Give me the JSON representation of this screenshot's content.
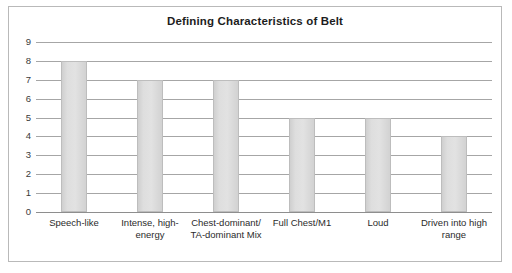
{
  "chart_data": {
    "type": "bar",
    "title": "Defining Characteristics of Belt",
    "xlabel": "",
    "ylabel": "",
    "ylim": [
      0,
      9
    ],
    "ytick_step": 1,
    "yticks": [
      "9",
      "8",
      "7",
      "6",
      "5",
      "4",
      "3",
      "2",
      "1",
      "0"
    ],
    "grid": true,
    "legend": "none",
    "categories": [
      "Speech-like",
      "Intense, high-energy",
      "Chest-dominant/ TA-dominant Mix",
      "Full Chest/M1",
      "Loud",
      "Driven into high range"
    ],
    "category_lines": [
      [
        "Speech-like"
      ],
      [
        "Intense, high-",
        "energy"
      ],
      [
        "Chest-dominant/",
        "TA-dominant Mix"
      ],
      [
        "Full Chest/M1"
      ],
      [
        "Loud"
      ],
      [
        "Driven into high",
        "range"
      ]
    ],
    "values": [
      8,
      7,
      7,
      5,
      5,
      4
    ],
    "colors": {
      "bar_fill": "#dedede",
      "bar_border": "#bdbdbd",
      "gridline": "#a6a6a6",
      "axis": "#8e8e8e",
      "title_text": "#1d1d1d",
      "label_text": "#2b2b2b",
      "frame_border": "#b9b9b9",
      "background": "#ffffff"
    }
  }
}
